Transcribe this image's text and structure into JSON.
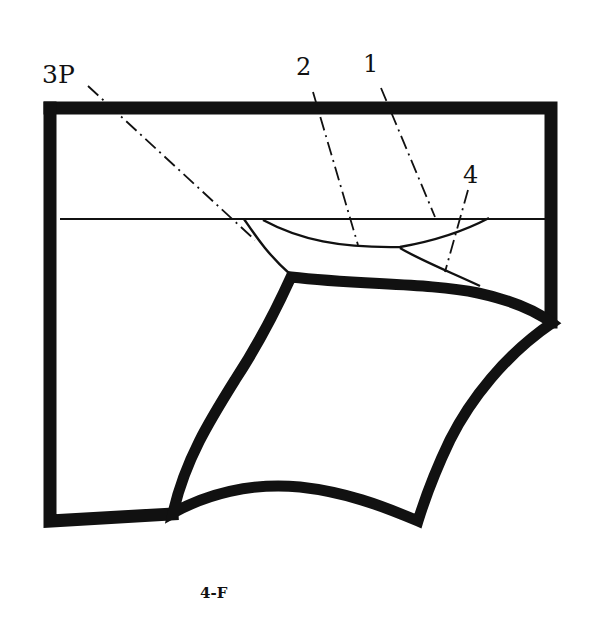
{
  "figure": {
    "caption": "4-F",
    "colors": {
      "ink": "#111111",
      "background": "#ffffff"
    },
    "labels": [
      {
        "id": "3P",
        "text": "3P"
      },
      {
        "id": "2",
        "text": "2"
      },
      {
        "id": "1",
        "text": "1"
      },
      {
        "id": "4",
        "text": "4"
      }
    ],
    "parts": [
      {
        "id": "frame",
        "description": "outer block outline (thick)"
      },
      {
        "id": "reference-line",
        "description": "horizontal thin line across frame"
      },
      {
        "id": "crescent",
        "description": "lens-shaped region bounded by thin arc below reference line"
      },
      {
        "id": "inner-profile",
        "description": "thick curved quadrilateral profile"
      }
    ]
  }
}
